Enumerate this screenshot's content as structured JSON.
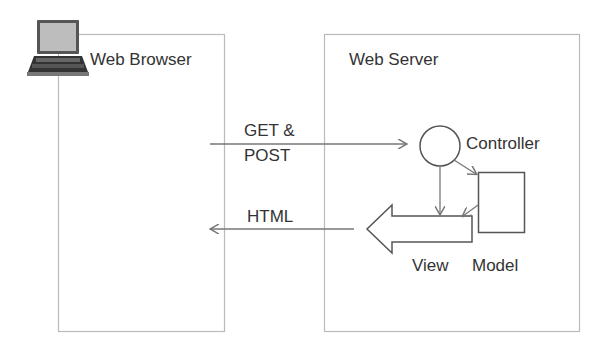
{
  "diagram": {
    "type": "mvc-architecture",
    "browser": {
      "label": "Web Browser",
      "icon": "laptop-icon"
    },
    "server": {
      "label": "Web Server"
    },
    "request": {
      "label_line1": "GET &",
      "label_line2": "POST"
    },
    "response": {
      "label": "HTML"
    },
    "components": {
      "controller": "Controller",
      "model": "Model",
      "view": "View"
    },
    "colors": {
      "box_border": "#b8b8b8",
      "arrow": "#777777",
      "shape_stroke": "#555555",
      "text": "#333333"
    }
  }
}
